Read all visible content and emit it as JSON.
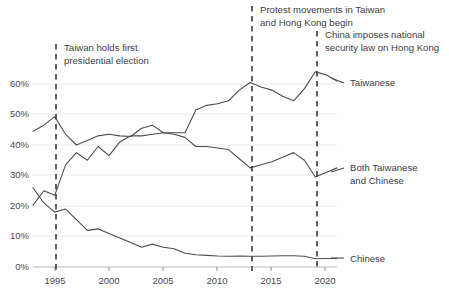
{
  "chart_data": {
    "type": "line",
    "title": "",
    "subtitle": "",
    "xlabel": "",
    "ylabel": "",
    "xlim": [
      1994,
      2022
    ],
    "ylim": [
      0,
      68
    ],
    "grid": true,
    "legend_position": "right-inline",
    "y_ticks": [
      "0%",
      "10%",
      "20%",
      "30%",
      "40%",
      "50%",
      "60%"
    ],
    "y_tick_values": [
      0,
      10,
      20,
      30,
      40,
      50,
      60
    ],
    "x_ticks": [
      "1995",
      "2000",
      "2005",
      "2010",
      "2015",
      "2020"
    ],
    "x_tick_values": [
      1995,
      2000,
      2005,
      2010,
      2015,
      2020
    ],
    "x": [
      1994,
      1995,
      1996,
      1997,
      1998,
      1999,
      2000,
      2001,
      2002,
      2003,
      2004,
      2005,
      2006,
      2007,
      2008,
      2009,
      2010,
      2011,
      2012,
      2013,
      2014,
      2015,
      2016,
      2017,
      2018,
      2019,
      2020,
      2021,
      2022
    ],
    "series": [
      {
        "name": "Taiwanese",
        "label": "Taiwanese",
        "color": "#4d4d4d",
        "values": [
          44.5,
          46.5,
          49.3,
          43.5,
          40.0,
          41.5,
          43.0,
          43.5,
          43.0,
          42.8,
          45.5,
          46.5,
          44.0,
          44.0,
          44.0,
          51.5,
          53.0,
          53.5,
          54.5,
          58.0,
          60.5,
          59.0,
          58.0,
          56.0,
          54.5,
          58.5,
          64.0,
          63.0,
          61.0
        ]
      },
      {
        "name": "Both Taiwanese and Chinese",
        "label": "Both Taiwanese and Chinese",
        "color": "#4d4d4d",
        "values": [
          20.3,
          25.0,
          23.5,
          33.5,
          37.5,
          35.0,
          39.5,
          36.5,
          41.0,
          43.0,
          43.0,
          43.5,
          44.0,
          43.5,
          42.5,
          39.5,
          39.5,
          39.0,
          38.5,
          35.5,
          32.5,
          33.5,
          34.5,
          36.0,
          37.5,
          35.0,
          29.5,
          31.0,
          32.5
        ]
      },
      {
        "name": "Chinese",
        "label": "Chinese",
        "color": "#4d4d4d",
        "values": [
          26.0,
          21.0,
          18.0,
          19.0,
          15.5,
          12.0,
          12.5,
          11.0,
          9.5,
          8.0,
          6.5,
          7.5,
          6.5,
          6.0,
          4.5,
          4.0,
          3.8,
          3.6,
          3.5,
          3.6,
          3.5,
          3.5,
          3.6,
          3.7,
          3.7,
          3.5,
          2.7,
          2.8,
          2.8
        ]
      }
    ],
    "annotations": [
      {
        "id": "annotation-1996-election",
        "year": 1996,
        "lines": [
          "Taiwan holds first",
          "presidential election"
        ]
      },
      {
        "id": "annotation-2014-protests",
        "year": 2014,
        "lines": [
          "Protest movements in Taiwan",
          "and Hong Kong begin"
        ]
      },
      {
        "id": "annotation-2020-security-law",
        "year": 2020,
        "lines": [
          "China imposes national",
          "security law on Hong Kong"
        ]
      }
    ]
  },
  "legend": {
    "taiwanese": "Taiwanese",
    "both_line1": "Both Taiwanese",
    "both_line2": "and Chinese",
    "chinese": "Chinese"
  },
  "annotations": {
    "a1_line1": "Taiwan holds first",
    "a1_line2": "presidential election",
    "a2_line1": "Protest movements in Taiwan",
    "a2_line2": "and Hong Kong begin",
    "a3_line1": "China imposes national",
    "a3_line2": "security law on Hong Kong"
  },
  "axis": {
    "y0": "0%",
    "y10": "10%",
    "y20": "20%",
    "y30": "30%",
    "y40": "40%",
    "y50": "50%",
    "y60": "60%",
    "x1995": "1995",
    "x2000": "2000",
    "x2005": "2005",
    "x2010": "2010",
    "x2015": "2015",
    "x2020": "2020"
  },
  "colors": {
    "line": "#4d4d4d",
    "grid": "#e9e9e9",
    "text": "#3d3d3d",
    "background": "#ffffff"
  }
}
